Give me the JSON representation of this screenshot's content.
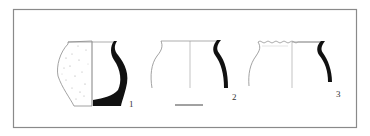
{
  "figure": {
    "type": "archaeological pottery profile drawing",
    "frame_color": "#8a8a8a",
    "section_fill": "#111111",
    "outline_color": "#7a7a7a",
    "vessels": [
      {
        "id": 1,
        "label": "1",
        "description": "globular jar, left half exterior with speckled surface, right half black section profile including base"
      },
      {
        "id": 2,
        "label": "2",
        "description": "jar with everted rim, left exterior outline, right black section profile"
      },
      {
        "id": 3,
        "label": "3",
        "description": "jar with notched/crimped rim, left exterior outline, right black section profile"
      }
    ],
    "scale_bar": {
      "present": true
    }
  }
}
